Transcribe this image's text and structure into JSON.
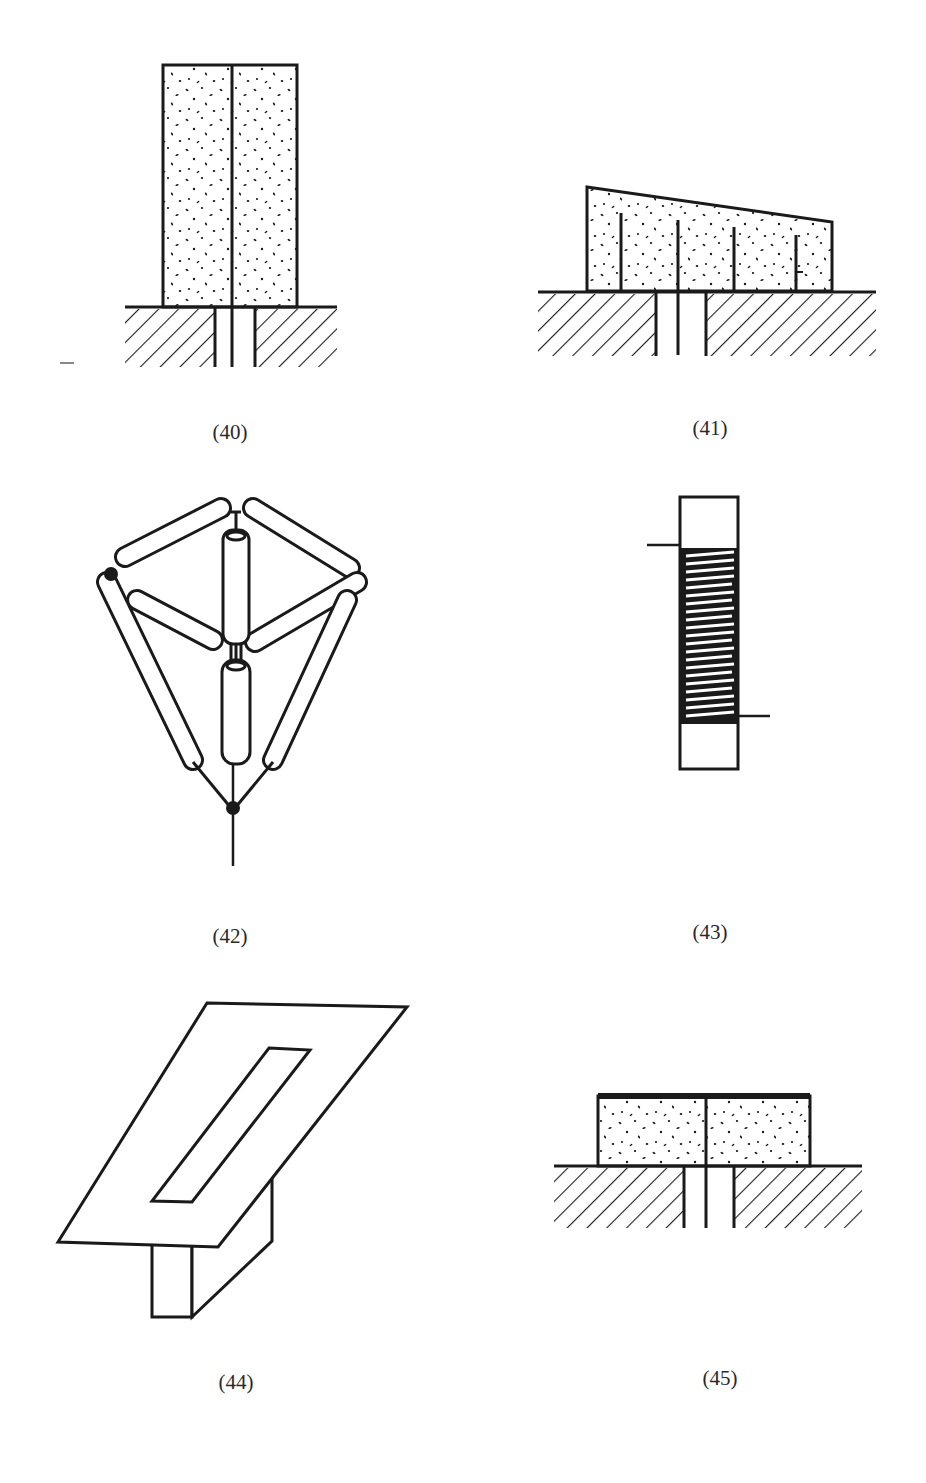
{
  "figures": [
    {
      "id": "40",
      "label": "(40)",
      "description": "Tall dotted block with central slit on hatched ground with central gap"
    },
    {
      "id": "41",
      "label": "(41)",
      "description": "Sloped-top dotted block with four vertical slits on hatched ground with central gap"
    },
    {
      "id": "42",
      "label": "(42)",
      "description": "Tripod/tetrahedral frame of rod elements converging to a point with feed line"
    },
    {
      "id": "43",
      "label": "(43)",
      "description": "Helical coil wound around a rectangular rod with two lead wires"
    },
    {
      "id": "44",
      "label": "(44)",
      "description": "Slotted plate in perspective on top of a rectangular support beam"
    },
    {
      "id": "45",
      "label": "(45)",
      "description": "Low dotted block with thick top plate and central slit on hatched ground with central gap"
    }
  ],
  "colors": {
    "ink": "#1a1a1a",
    "paper": "#ffffff",
    "caption": "#2a2a2a"
  }
}
